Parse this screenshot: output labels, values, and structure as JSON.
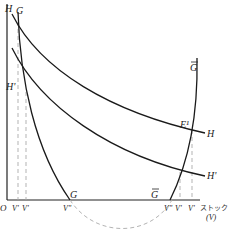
{
  "figure": {
    "type": "economic-diagram",
    "axis": {
      "origin_label": "O",
      "x_label": "ストック",
      "x_unit_label": "(V)"
    },
    "curves": [
      {
        "id": "H",
        "label_start": "H",
        "label_end": "H",
        "style": "solid"
      },
      {
        "id": "H-prime",
        "label_start": "H'",
        "label_end": "H'",
        "style": "solid"
      },
      {
        "id": "G",
        "label_top": "G",
        "label_bottom": "G",
        "style": "solid"
      },
      {
        "id": "G-bar",
        "label_top": "G",
        "label_bottom": "G",
        "style": "solid",
        "bar": true
      },
      {
        "id": "arc",
        "style": "dashed"
      }
    ],
    "points": {
      "equilibrium": "E¹"
    },
    "x_ticks": [
      "V'",
      "V'",
      "V''",
      "V''",
      "V'",
      "V'"
    ],
    "colors": {
      "curve": "#1a1a1a",
      "dashed": "#aaaaaa",
      "axis": "#222222"
    }
  }
}
